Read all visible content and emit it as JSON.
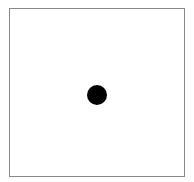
{
  "scene": {
    "frame": {
      "border_color": "#8a8a8a",
      "background_color": "#ffffff"
    },
    "dot": {
      "shape": "circle",
      "color": "#000000",
      "center_x": 97,
      "center_y": 95,
      "diameter": 20
    }
  }
}
